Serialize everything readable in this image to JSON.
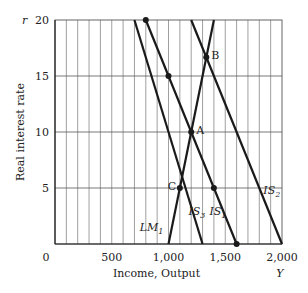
{
  "chart_data": {
    "type": "line",
    "title": "",
    "xlabel": "Income, Output",
    "xlabel_symbol": "Y",
    "ylabel": "Real interest rate",
    "ylabel_symbol": "r",
    "xlim": [
      0,
      2000
    ],
    "ylim": [
      0,
      20
    ],
    "x_ticks": [
      0,
      500,
      1000,
      1500,
      2000
    ],
    "x_tick_labels": [
      "0",
      "500",
      "1,000",
      "1,500",
      "2,000"
    ],
    "y_ticks": [
      5,
      10,
      15,
      20
    ],
    "y_tick_labels": [
      "5",
      "10",
      "15",
      "20"
    ],
    "grid": {
      "x_step": 100,
      "y_step": 5
    },
    "series": [
      {
        "name": "IS3",
        "label_main": "IS",
        "label_sub": "3",
        "points": [
          [
            700,
            20
          ],
          [
            1300,
            0
          ]
        ]
      },
      {
        "name": "IS1",
        "label_main": "IS",
        "label_sub": "1",
        "points": [
          [
            800,
            20
          ],
          [
            1600,
            0
          ]
        ]
      },
      {
        "name": "IS2",
        "label_main": "IS",
        "label_sub": "2",
        "points": [
          [
            1200,
            20
          ],
          [
            2000,
            0
          ]
        ]
      },
      {
        "name": "LM1",
        "label_main": "LM",
        "label_sub": "1",
        "points": [
          [
            1000,
            0
          ],
          [
            1400,
            20
          ]
        ]
      }
    ],
    "markers": [
      {
        "x": 800,
        "y": 20,
        "label": ""
      },
      {
        "x": 1000,
        "y": 15,
        "label": ""
      },
      {
        "x": 1400,
        "y": 5,
        "label": ""
      },
      {
        "x": 1600,
        "y": 0,
        "label": ""
      },
      {
        "x": 1333,
        "y": 16.67,
        "label": "B"
      },
      {
        "x": 1200,
        "y": 10,
        "label": "A"
      },
      {
        "x": 1100,
        "y": 5,
        "label": "C"
      }
    ],
    "legend": "none (curves labeled inline)"
  },
  "colors": {
    "line": "#1a1a1a",
    "grid": "#888888",
    "text": "#222222"
  }
}
